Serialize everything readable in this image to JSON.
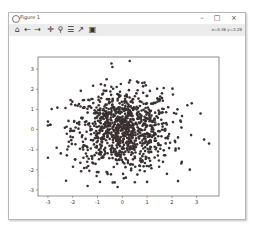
{
  "window": {
    "title": "Figure 1",
    "controls": {
      "minimize": "–",
      "maximize": "□",
      "close": "×"
    }
  },
  "toolbar": {
    "tools": [
      {
        "name": "home-icon",
        "glyph": "⌂"
      },
      {
        "name": "back-arrow-icon",
        "glyph": "←"
      },
      {
        "name": "forward-arrow-icon",
        "glyph": "→"
      },
      {
        "name": "pan-icon",
        "glyph": "✛"
      },
      {
        "name": "zoom-icon",
        "glyph": "⚲"
      },
      {
        "name": "subplots-config-icon",
        "glyph": "☰"
      },
      {
        "name": "edit-axis-icon",
        "glyph": "↗"
      },
      {
        "name": "save-icon",
        "glyph": "▣"
      }
    ],
    "coords": "x=0.36 y=3.28"
  },
  "chart_data": {
    "type": "scatter",
    "title": "",
    "xlabel": "",
    "ylabel": "",
    "xlim": [
      -3.4,
      3.9
    ],
    "ylim": [
      -3.3,
      3.6
    ],
    "xticks": [
      "-3",
      "-2",
      "-1",
      "0",
      "1",
      "2",
      "3"
    ],
    "yticks": [
      "3",
      "2",
      "1",
      "0",
      "-1",
      "-2",
      "-3"
    ],
    "grid": false,
    "marker_color": "#3a3030",
    "n_points": 1000,
    "outliers": [
      {
        "x": -3.0,
        "y": 0.2
      },
      {
        "x": -3.0,
        "y": -1.4
      },
      {
        "x": -0.4,
        "y": 3.1
      },
      {
        "x": 0.3,
        "y": 3.4
      },
      {
        "x": 3.3,
        "y": -0.5
      },
      {
        "x": 3.5,
        "y": -0.7
      },
      {
        "x": -1.4,
        "y": -2.8
      },
      {
        "x": -0.9,
        "y": -2.6
      },
      {
        "x": 1.0,
        "y": -2.6
      },
      {
        "x": 1.8,
        "y": -2.2
      },
      {
        "x": 2.4,
        "y": -1.6
      },
      {
        "x": 2.8,
        "y": 1.3
      }
    ]
  }
}
